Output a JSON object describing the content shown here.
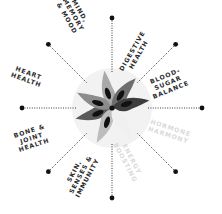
{
  "diagram": {
    "center": {
      "x": 112,
      "y": 108
    },
    "colors": {
      "background": "#ffffff",
      "halo": "#f2f2f2",
      "spoke": "#222222",
      "faded_label": "#d9d9d9",
      "label": "#2b2b2b",
      "seed": "#111111"
    },
    "spokes": [
      {
        "id": "n",
        "angle": -90,
        "inner": 36,
        "outer": 90
      },
      {
        "id": "ne",
        "angle": -45,
        "inner": 36,
        "outer": 90
      },
      {
        "id": "e",
        "angle": 0,
        "inner": 36,
        "outer": 90
      },
      {
        "id": "se",
        "angle": 45,
        "inner": 36,
        "outer": 90
      },
      {
        "id": "s",
        "angle": 90,
        "inner": 36,
        "outer": 90
      },
      {
        "id": "sw",
        "angle": 135,
        "inner": 36,
        "outer": 90
      },
      {
        "id": "w",
        "angle": 180,
        "inner": 36,
        "outer": 90
      },
      {
        "id": "nw",
        "angle": -135,
        "inner": 36,
        "outer": 90
      }
    ],
    "labels": [
      {
        "name": "mind-memory-mood",
        "lines": [
          "MIND,",
          "MEMORY",
          "& MOOD"
        ],
        "x": 78,
        "y": 12,
        "rotate": 60,
        "faded": false
      },
      {
        "name": "digestive-health",
        "lines": [
          "DIGESTIVE",
          "HEALTH"
        ],
        "x": 134,
        "y": 52,
        "rotate": -60,
        "faded": false
      },
      {
        "name": "blood-sugar-balance",
        "lines": [
          "BLOOD-",
          "SUGAR",
          "BALANCE"
        ],
        "x": 166,
        "y": 78,
        "rotate": -22,
        "faded": false
      },
      {
        "name": "hormone-harmony",
        "lines": [
          "HORMONE",
          "HARMONY"
        ],
        "x": 170,
        "y": 130,
        "rotate": 18,
        "faded": true
      },
      {
        "name": "energy-boosting",
        "lines": [
          "ENERGY",
          "BOOSTING"
        ],
        "x": 130,
        "y": 160,
        "rotate": 62,
        "faded": true
      },
      {
        "name": "skin-senses-immunity",
        "lines": [
          "SKIN,",
          "SENSES &",
          "IMMUNITY"
        ],
        "x": 76,
        "y": 172,
        "rotate": -62,
        "faded": false
      },
      {
        "name": "bone-joint-health",
        "lines": [
          "BONE &",
          "JOINT",
          "HEALTH"
        ],
        "x": 30,
        "y": 133,
        "rotate": -18,
        "faded": false
      },
      {
        "name": "heart-health",
        "lines": [
          "HEART",
          "HEALTH"
        ],
        "x": 28,
        "y": 75,
        "rotate": 20,
        "faded": false
      }
    ],
    "petals": [
      {
        "angle": -100,
        "fill": "#a9a9a9"
      },
      {
        "angle": -50,
        "fill": "#6e6e6e"
      },
      {
        "angle": -10,
        "fill": "#3c3c3c"
      },
      {
        "angle": 165,
        "fill": "#5a5a5a"
      },
      {
        "angle": 205,
        "fill": "#8c8c8c"
      },
      {
        "angle": 115,
        "fill": "#bdbdbd"
      },
      {
        "angle": 60,
        "fill": "#f0f0f0"
      }
    ]
  }
}
